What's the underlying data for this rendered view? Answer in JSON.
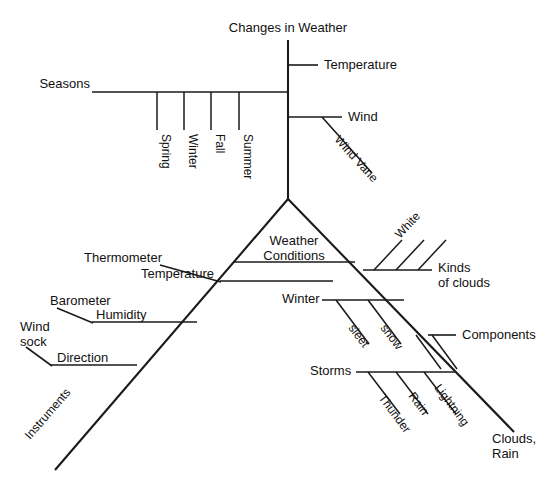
{
  "diagram": {
    "type": "fishbone-concept-map",
    "title": "Changes in Weather",
    "stroke_color": "#1a1a1a",
    "background_color": "#ffffff",
    "nodes": {
      "root": "Changes in Weather",
      "temperature_branch": "Temperature",
      "seasons_branch": "Seasons",
      "seasons": [
        "Spring",
        "Winter",
        "Fall",
        "Summer"
      ],
      "wind_branch": "Wind",
      "wind_sub": "Wind Vane",
      "center": "Weather",
      "center_line2": "Conditions",
      "left_arm": "Instruments",
      "right_arm_line1": "Clouds,",
      "right_arm_line2": "Rain",
      "left_branches": [
        {
          "head": "Thermometer",
          "value": "Temperature"
        },
        {
          "head": "Barometer",
          "value": "Humidity"
        },
        {
          "head_line1": "Wind",
          "head_line2": "sock",
          "value": "Direction"
        }
      ],
      "right_branches": [
        {
          "label_line1": "Kinds",
          "label_line2": "of clouds",
          "subs": [
            "White"
          ]
        },
        {
          "label": "Winter",
          "subs": [
            "sleet",
            "snow"
          ]
        },
        {
          "label": "Components",
          "subs": []
        },
        {
          "label": "Storms",
          "subs": [
            "Thunder",
            "Rain",
            "Lightning"
          ]
        }
      ]
    }
  }
}
